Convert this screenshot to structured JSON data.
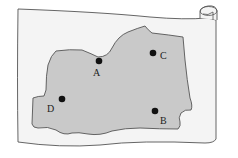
{
  "diagram": {
    "type": "map-on-scroll",
    "colors": {
      "paper": "#f4f4f4",
      "paper_stroke": "#555555",
      "region": "#c9c9c9",
      "region_stroke": "#555555",
      "point": "#111111",
      "label": "#222222"
    },
    "points": [
      {
        "id": "A",
        "label": "A",
        "x": 99,
        "y": 61,
        "label_x": 93,
        "label_y": 76
      },
      {
        "id": "B",
        "label": "B",
        "x": 155,
        "y": 111,
        "label_x": 160,
        "label_y": 124
      },
      {
        "id": "C",
        "label": "C",
        "x": 153,
        "y": 53,
        "label_x": 160,
        "label_y": 59
      },
      {
        "id": "D",
        "label": "D",
        "x": 62,
        "y": 99,
        "label_x": 47,
        "label_y": 112
      }
    ]
  }
}
